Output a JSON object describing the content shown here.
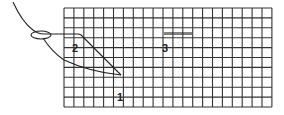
{
  "diagram": {
    "type": "stitch-diagram",
    "grid": {
      "x": 64,
      "y": 8,
      "cols": 21,
      "rows": 10,
      "cell": 9.9,
      "line_color": "#333333",
      "background": "#ffffff"
    },
    "labels": [
      {
        "id": "step-1",
        "text": "1",
        "x": 118,
        "y": 93
      },
      {
        "id": "step-2",
        "text": "2",
        "x": 73,
        "y": 44
      },
      {
        "id": "step-3",
        "text": "3",
        "x": 164,
        "y": 44
      }
    ],
    "stitches": [
      {
        "id": "thread-tail",
        "desc": "thread curve to needle eye"
      },
      {
        "id": "needle-eye",
        "desc": "needle eye loop"
      },
      {
        "id": "stitch-2-top",
        "desc": "straight stitch top to diagonal"
      },
      {
        "id": "stitch-2-diagonal",
        "desc": "diagonal stitch down to point 1"
      },
      {
        "id": "stitch-2-return",
        "desc": "curved return thread"
      },
      {
        "id": "stitch-3",
        "desc": "short horizontal stitch"
      }
    ],
    "colors": {
      "ink": "#222222",
      "grid": "#333333"
    }
  }
}
